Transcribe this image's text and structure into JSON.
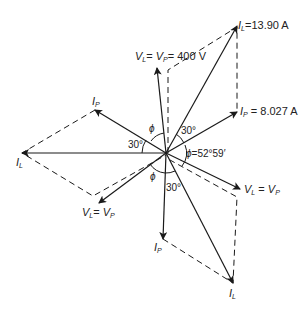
{
  "diagram": {
    "type": "phasor-diagram",
    "center": {
      "x": 166,
      "y": 153
    },
    "colors": {
      "line": "#1a1a1a",
      "background": "#ffffff"
    },
    "labels": {
      "il_top": {
        "sym": "I",
        "sub": "L",
        "value": "=13.90 A"
      },
      "v_top": {
        "text_a": "V",
        "sub_a": "L",
        "eq": "= ",
        "text_b": "V",
        "sub_b": "P",
        "value": "= 400 V"
      },
      "ip_right": {
        "sym": "I",
        "sub": "P",
        "value": " = 8.027 A"
      },
      "ip_left": {
        "sym": "I",
        "sub": "P"
      },
      "il_left": {
        "sym": "I",
        "sub": "L"
      },
      "v_lowleft": {
        "text_a": "V",
        "sub_a": "L",
        "eq": "= ",
        "text_b": "V",
        "sub_b": "P"
      },
      "v_lowright": {
        "text_a": "V",
        "sub_a": "L",
        "eq": " = ",
        "text_b": "V",
        "sub_b": "P"
      },
      "ip_bottom": {
        "sym": "I",
        "sub": "P"
      },
      "il_bottom": {
        "sym": "I",
        "sub": "L"
      }
    },
    "angles": {
      "a30_upper_right": "30°",
      "a30_left": "30°",
      "a30_bottom": "30°",
      "phi_top": "ϕ",
      "phi_bottom": "ϕ",
      "phi_right": "ϕ",
      "phi_right_value": "=52°59′"
    }
  }
}
